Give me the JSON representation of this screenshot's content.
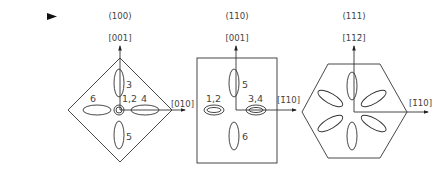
{
  "marker": {
    "icon": "triangle-right-icon",
    "color": "#111111"
  },
  "panels": [
    {
      "plane": "(100)",
      "up_direction": "[001]",
      "right_direction": "[010]",
      "shape": "diamond",
      "ellipse_labels": {
        "top": "3",
        "center": "1,2",
        "right": "4",
        "left": "6",
        "bottom": "5"
      }
    },
    {
      "plane": "(110)",
      "up_direction": "[001]",
      "right_direction": "[1̄10]",
      "shape": "rectangle",
      "ellipse_labels": {
        "top": "5",
        "left": "1,2",
        "right": "3,4",
        "bottom": "6"
      }
    },
    {
      "plane": "(111)",
      "up_direction": "[112̄]",
      "right_direction": "[1̄10]",
      "shape": "hexagon",
      "ellipse_count": 6
    }
  ]
}
